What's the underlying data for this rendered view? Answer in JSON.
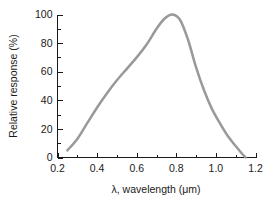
{
  "figure": {
    "background_color": "#ffffff",
    "text_color": "#1a1a1a",
    "axis_color": "#1a1a1a"
  },
  "chart_data": {
    "type": "line",
    "title": "",
    "subtitle": "",
    "xlabel": "λ, wavelength (μm)",
    "ylabel": "Relative response (%)",
    "xlim": [
      0.2,
      1.2
    ],
    "ylim": [
      0,
      100
    ],
    "grid": false,
    "legend": null,
    "legend_position": "none",
    "series_color": "#999999",
    "x_ticks": [
      0.2,
      0.4,
      0.6,
      0.8,
      1.0,
      1.2
    ],
    "x_tick_labels": [
      "0.2",
      "0.4",
      "0.6",
      "0.8",
      "1.0",
      "1.2"
    ],
    "x_minor_ticks": [
      0.3,
      0.5,
      0.7,
      0.9,
      1.1
    ],
    "y_ticks": [
      0,
      20,
      40,
      60,
      80,
      100
    ],
    "y_tick_labels": [
      "0",
      "20",
      "40",
      "60",
      "80",
      "100"
    ],
    "y_minor_ticks": [
      10,
      30,
      50,
      70,
      90,
      110
    ],
    "series": [
      {
        "name": "Relative response",
        "x": [
          0.25,
          0.3,
          0.35,
          0.4,
          0.45,
          0.5,
          0.55,
          0.6,
          0.65,
          0.7,
          0.74,
          0.78,
          0.82,
          0.86,
          0.9,
          0.94,
          0.98,
          1.02,
          1.06,
          1.1,
          1.13,
          1.15
        ],
        "values": [
          5,
          13,
          24,
          35,
          45,
          54,
          62,
          70,
          79,
          90,
          97,
          100,
          96,
          82,
          63,
          47,
          34,
          24,
          15,
          8,
          3,
          0
        ]
      }
    ]
  }
}
